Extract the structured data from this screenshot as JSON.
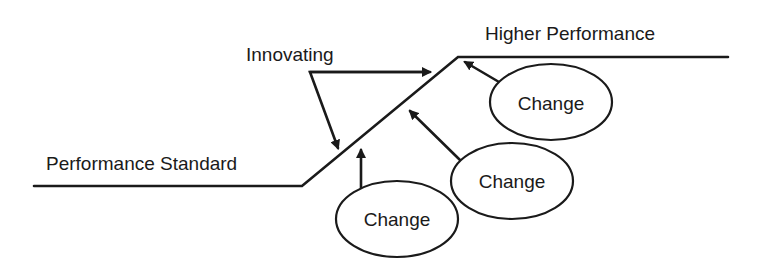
{
  "diagram": {
    "labels": {
      "innovating": "Innovating",
      "higher_performance": "Higher Performance",
      "performance_standard": "Performance Standard"
    },
    "changes": [
      {
        "label": "Change"
      },
      {
        "label": "Change"
      },
      {
        "label": "Change"
      }
    ],
    "colors": {
      "ink": "#1a1a1a",
      "background": "#ffffff"
    }
  }
}
